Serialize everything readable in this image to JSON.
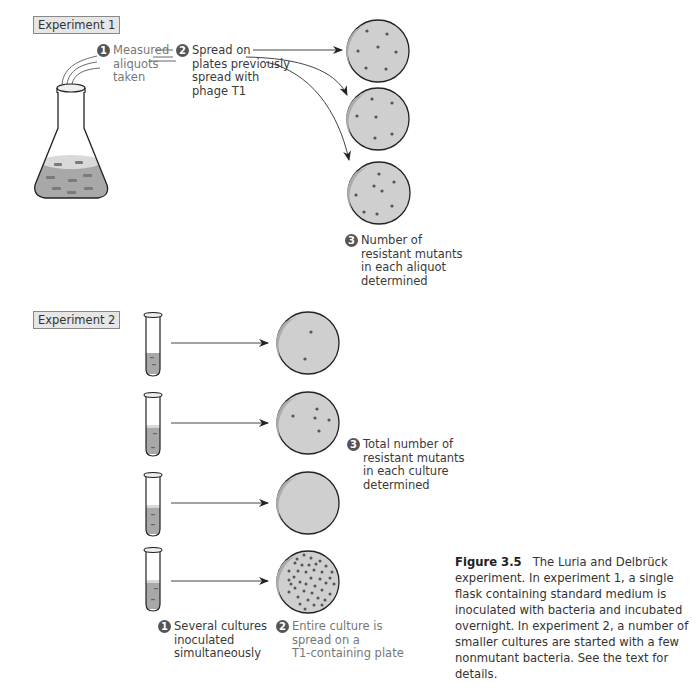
{
  "experiment1": {
    "label": "Experiment 1",
    "step1": {
      "number": "1",
      "lines": [
        "Measured",
        "aliquots",
        "taken"
      ]
    },
    "step2": {
      "number": "2",
      "lines": [
        "Spread on",
        "plates previously",
        "spread with",
        "phage T1"
      ]
    },
    "step3": {
      "number": "3",
      "lines": [
        "Number of",
        "resistant mutants",
        "in each aliquot",
        "determined"
      ]
    },
    "plates": [
      {
        "colonies": 7
      },
      {
        "colonies": 6
      },
      {
        "colonies": 8
      }
    ]
  },
  "experiment2": {
    "label": "Experiment 2",
    "step1": {
      "number": "1",
      "lines": [
        "Several cultures",
        "inoculated",
        "simultaneously"
      ]
    },
    "step2": {
      "number": "2",
      "lines": [
        "Entire culture is",
        "spread on a",
        "T1-containing plate"
      ]
    },
    "step3": {
      "number": "3",
      "lines": [
        "Total number of",
        "resistant mutants",
        "in each culture",
        "determined"
      ]
    },
    "plates": [
      {
        "colonies": 2
      },
      {
        "colonies": 5
      },
      {
        "colonies": 0
      },
      {
        "colonies": 40
      }
    ]
  },
  "caption": {
    "figure_label": "Figure 3.5",
    "text": "The Luria and Delbrück experiment. In experiment 1, a single flask containing standard medium is inoculated with bacteria and incubated overnight. In experiment 2, a number of smaller cultures are started with a few nonmutant bacteria. See the text for details."
  },
  "colors": {
    "plate_fill": "#cfcfcf",
    "plate_shade": "#a9a9a9",
    "colony": "#555555",
    "medium": "#a8a8a8",
    "outline": "#222222"
  }
}
